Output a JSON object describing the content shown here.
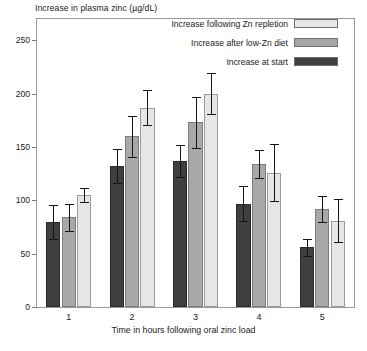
{
  "figure": {
    "y_axis_title": "Increase in plasma zinc (µg/dL)",
    "x_axis_title": "Time in hours following oral zinc load",
    "caption_partial": ""
  },
  "legend": {
    "position": "top-right-inside",
    "entries": [
      {
        "label": "Increase following Zn repletion",
        "color": "#e6e6e6",
        "series_key": "repletion"
      },
      {
        "label": "Increase after low-Zn diet",
        "color": "#a8a8a8",
        "series_key": "low_zn_diet"
      },
      {
        "label": "Increase at start",
        "color": "#3f3f3f",
        "series_key": "at_start"
      }
    ]
  },
  "chart_data": {
    "type": "bar",
    "title": "",
    "xlabel": "Time in hours following oral zinc load",
    "ylabel": "Increase in plasma zinc (µg/dL)",
    "categories": [
      "1",
      "2",
      "3",
      "4",
      "5"
    ],
    "ylim": [
      0,
      270
    ],
    "yticks": [
      0,
      50,
      100,
      150,
      200,
      250
    ],
    "grid": false,
    "error_bars": "symmetric",
    "series": [
      {
        "name": "Increase at start",
        "color": "#3f3f3f",
        "values": [
          80,
          132,
          137,
          97,
          56
        ],
        "errors": [
          16,
          16,
          15,
          16,
          8
        ]
      },
      {
        "name": "Increase after low-Zn diet",
        "color": "#a8a8a8",
        "values": [
          84,
          160,
          173,
          134,
          92
        ],
        "errors": [
          13,
          19,
          24,
          13,
          12
        ]
      },
      {
        "name": "Increase following Zn repletion",
        "color": "#e6e6e6",
        "values": [
          105,
          187,
          200,
          126,
          81
        ],
        "errors": [
          7,
          16,
          19,
          27,
          20
        ]
      }
    ]
  }
}
